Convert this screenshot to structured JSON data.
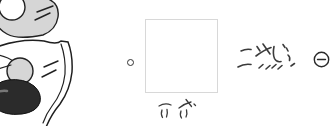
{
  "canvas": {
    "width": 335,
    "height": 126,
    "background": "#ffffff"
  },
  "colors": {
    "ink": "#222222",
    "light_gray_fill": "#d6d6d6",
    "dark_blob": "#2b2b2b",
    "box_border": "#d8d8d8",
    "handwriting_ink": "#3b3b3b"
  },
  "annotations": {
    "right_text": "こすじ、",
    "below_box_text": "六 父",
    "minus_icon": "⊖"
  }
}
